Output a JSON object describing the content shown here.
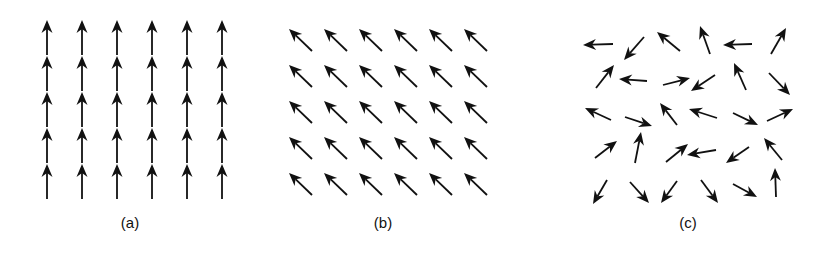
{
  "figure": {
    "arrow_color": "#111111",
    "background": "#ffffff"
  },
  "panels": [
    {
      "id": "a",
      "label": "(a)",
      "label_x": 130,
      "pattern": "aligned-vertical",
      "direction": "up",
      "columns": [
        47,
        82,
        117,
        152,
        187,
        222
      ],
      "rows": [
        {
          "tail_y": 55,
          "head_y": 20
        },
        {
          "tail_y": 91,
          "head_y": 56
        },
        {
          "tail_y": 127,
          "head_y": 92
        },
        {
          "tail_y": 163,
          "head_y": 128
        },
        {
          "tail_y": 199,
          "head_y": 164
        }
      ]
    },
    {
      "id": "b",
      "label": "(b)",
      "label_x": 383,
      "pattern": "aligned-diagonal",
      "direction": "up-left",
      "origin_head": [
        289,
        29
      ],
      "tail_offset": [
        23,
        22
      ],
      "col_spacing": 35,
      "row_spacing": 36,
      "cols": 6,
      "rows": 5
    },
    {
      "id": "c",
      "label": "(c)",
      "label_x": 688,
      "pattern": "random",
      "arrows": [
        [
          613,
          44,
          583,
          45
        ],
        [
          644,
          37,
          624,
          60
        ],
        [
          680,
          51,
          657,
          32
        ],
        [
          710,
          54,
          700,
          26
        ],
        [
          752,
          44,
          723,
          45
        ],
        [
          771,
          54,
          786,
          28
        ],
        [
          596,
          88,
          614,
          65
        ],
        [
          647,
          81,
          619,
          79
        ],
        [
          663,
          85,
          690,
          78
        ],
        [
          715,
          75,
          691,
          91
        ],
        [
          746,
          90,
          734,
          63
        ],
        [
          769,
          73,
          790,
          95
        ],
        [
          611,
          120,
          585,
          108
        ],
        [
          625,
          117,
          652,
          126
        ],
        [
          677,
          125,
          660,
          103
        ],
        [
          717,
          118,
          689,
          109
        ],
        [
          733,
          113,
          758,
          125
        ],
        [
          767,
          121,
          793,
          109
        ],
        [
          595,
          158,
          617,
          141
        ],
        [
          635,
          163,
          641,
          132
        ],
        [
          666,
          162,
          688,
          144
        ],
        [
          716,
          150,
          687,
          155
        ],
        [
          749,
          147,
          726,
          163
        ],
        [
          782,
          160,
          764,
          138
        ],
        [
          607,
          180,
          593,
          204
        ],
        [
          630,
          182,
          649,
          203
        ],
        [
          677,
          181,
          661,
          203
        ],
        [
          701,
          180,
          718,
          203
        ],
        [
          733,
          184,
          757,
          197
        ],
        [
          776,
          197,
          775,
          168
        ]
      ]
    }
  ]
}
